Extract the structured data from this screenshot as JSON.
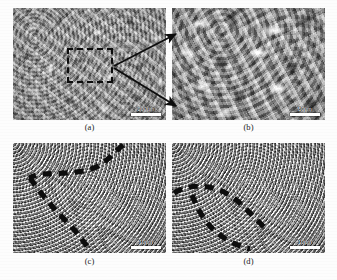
{
  "figure": {
    "type": "sem-micrograph-grid",
    "background_color": "#fdfdfd",
    "rows": 2,
    "columns": 2
  },
  "panels": [
    {
      "id": "a",
      "caption": "(a)",
      "texture": "coarse dendritic surface",
      "scalebar": {
        "label": "200μm",
        "bar_color": "#ffffff"
      },
      "annotation": {
        "kind": "dashed-rectangle",
        "color": "#0d0d0d"
      }
    },
    {
      "id": "b",
      "caption": "(b)",
      "texture": "magnified lamellar surface",
      "scalebar": {
        "label": "50μm",
        "bar_color": "#ffffff"
      },
      "annotation": {
        "kind": "none",
        "color": "#0d0d0d"
      }
    },
    {
      "id": "c",
      "caption": "(c)",
      "texture": "fine granular porous surface",
      "scalebar": {
        "label": "10μm",
        "bar_color": "#ffffff"
      },
      "annotation": {
        "kind": "dashed-boundary-curve",
        "color": "#0d0d0d"
      }
    },
    {
      "id": "d",
      "caption": "(d)",
      "texture": "fine granular porous surface",
      "scalebar": {
        "label": "10μm",
        "bar_color": "#ffffff"
      },
      "annotation": {
        "kind": "dashed-closed-boundary",
        "color": "#0d0d0d"
      }
    }
  ],
  "connectors": [
    {
      "name": "magnification-arrow-upper",
      "from_panel": "a",
      "to_panel": "b"
    },
    {
      "name": "magnification-arrow-lower",
      "from_panel": "a",
      "to_panel": "b"
    }
  ]
}
